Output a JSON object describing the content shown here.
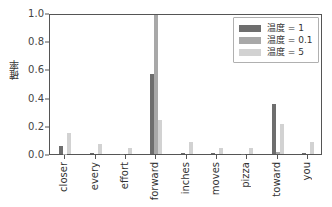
{
  "chart_data": {
    "type": "bar",
    "title": "",
    "xlabel": "",
    "ylabel": "確率",
    "ylim": [
      0.0,
      1.0
    ],
    "yticks": [
      "0.0",
      "0.2",
      "0.4",
      "0.6",
      "0.8",
      "1.0"
    ],
    "ytick_values": [
      0.0,
      0.2,
      0.4,
      0.6,
      0.8,
      1.0
    ],
    "grid": false,
    "legend_position": "upper right",
    "categories": [
      "closer",
      "every",
      "effort",
      "forward",
      "inches",
      "moves",
      "pizza",
      "toward",
      "you"
    ],
    "series": [
      {
        "name": "温度 = 1",
        "color": "#6e6e6e",
        "values": [
          0.06,
          0.004,
          0.003,
          0.57,
          0.004,
          0.004,
          0.003,
          0.355,
          0.004
        ]
      },
      {
        "name": "温度 = 0.1",
        "color": "#a8a8a8",
        "values": [
          0.002,
          0.0,
          0.0,
          0.985,
          0.0,
          0.0,
          0.0,
          0.012,
          0.0
        ]
      },
      {
        "name": "温度 = 5",
        "color": "#d2d2d2",
        "values": [
          0.15,
          0.072,
          0.04,
          0.24,
          0.082,
          0.045,
          0.04,
          0.213,
          0.086
        ]
      }
    ]
  },
  "legend": {
    "entries": [
      {
        "label": "温度 = 1",
        "swatch": "#6e6e6e"
      },
      {
        "label": "温度 = 0.1",
        "swatch": "#a8a8a8"
      },
      {
        "label": "温度 = 5",
        "swatch": "#d2d2d2"
      }
    ]
  },
  "axes": {
    "y_label": "確率",
    "y_tick_labels": [
      "1.0",
      "0.8",
      "0.6",
      "0.4",
      "0.2",
      "0.0"
    ],
    "x_tick_labels": [
      "closer",
      "every",
      "effort",
      "forward",
      "inches",
      "moves",
      "pizza",
      "toward",
      "you"
    ]
  },
  "colors": {
    "background": "#ffffff",
    "axis": "#555555",
    "text": "#333333",
    "legend_border": "#b0b0b0"
  }
}
